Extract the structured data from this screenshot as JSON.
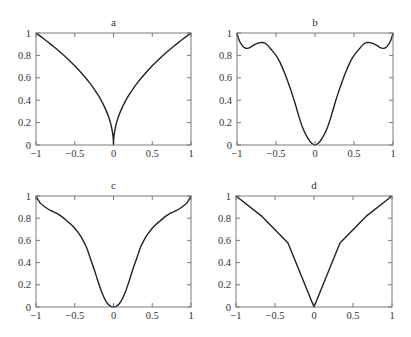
{
  "figure": {
    "width": 411,
    "height": 337,
    "colors": {
      "frame": "#7a7a7a",
      "curve": "#222222",
      "text": "#333333",
      "background": "#ffffff"
    }
  },
  "chart_data": [
    {
      "type": "line",
      "title": "a",
      "xlabel": "",
      "ylabel": "",
      "xlim": [
        -1,
        1
      ],
      "ylim": [
        0,
        1
      ],
      "xticks": [
        -1,
        -0.5,
        0,
        0.5,
        1
      ],
      "xtick_labels": [
        "−1",
        "−0.5",
        "0",
        "0.5",
        "1"
      ],
      "yticks": [
        0,
        0.2,
        0.4,
        0.6,
        0.8,
        1
      ],
      "ytick_labels": [
        "0",
        "0.2",
        "0.4",
        "0.6",
        "0.8",
        "1"
      ],
      "grid": false,
      "legend": null,
      "series": [
        {
          "name": "a",
          "x": [
            -1,
            -0.9,
            -0.8,
            -0.7,
            -0.6,
            -0.5,
            -0.4,
            -0.3,
            -0.2,
            -0.15,
            -0.1,
            -0.06,
            -0.03,
            -0.01,
            -0.002,
            0,
            0.002,
            0.01,
            0.03,
            0.06,
            0.1,
            0.15,
            0.2,
            0.3,
            0.4,
            0.5,
            0.6,
            0.7,
            0.8,
            0.9,
            1
          ],
          "y": [
            1,
            0.949,
            0.894,
            0.837,
            0.775,
            0.707,
            0.632,
            0.548,
            0.447,
            0.387,
            0.316,
            0.245,
            0.173,
            0.1,
            0.045,
            0,
            0.045,
            0.1,
            0.173,
            0.245,
            0.316,
            0.387,
            0.447,
            0.548,
            0.632,
            0.707,
            0.775,
            0.837,
            0.894,
            0.949,
            1
          ]
        }
      ],
      "frame_px": {
        "left": 36,
        "top": 33,
        "right": 191,
        "bottom": 145
      }
    },
    {
      "type": "line",
      "title": "b",
      "xlabel": "",
      "ylabel": "",
      "xlim": [
        -1,
        1
      ],
      "ylim": [
        0,
        1
      ],
      "xticks": [
        -1,
        -0.5,
        0,
        0.5,
        1
      ],
      "xtick_labels": [
        "−1",
        "−0.5",
        "0",
        "0.5",
        "1"
      ],
      "yticks": [
        0,
        0.2,
        0.4,
        0.6,
        0.8,
        1
      ],
      "ytick_labels": [
        "0",
        "0.2",
        "0.4",
        "0.6",
        "0.8",
        "1"
      ],
      "grid": false,
      "legend": null,
      "series": [
        {
          "name": "b",
          "x": [
            -1,
            -0.97,
            -0.93,
            -0.9,
            -0.87,
            -0.83,
            -0.78,
            -0.72,
            -0.67,
            -0.62,
            -0.57,
            -0.5,
            -0.45,
            -0.4,
            -0.35,
            -0.3,
            -0.25,
            -0.2,
            -0.15,
            -0.1,
            -0.05,
            0,
            0.05,
            0.1,
            0.15,
            0.2,
            0.25,
            0.3,
            0.35,
            0.4,
            0.45,
            0.5,
            0.57,
            0.62,
            0.67,
            0.72,
            0.78,
            0.83,
            0.87,
            0.9,
            0.93,
            0.97,
            1
          ],
          "y": [
            1,
            0.93,
            0.885,
            0.868,
            0.863,
            0.872,
            0.895,
            0.912,
            0.915,
            0.9,
            0.86,
            0.8,
            0.74,
            0.66,
            0.57,
            0.47,
            0.36,
            0.24,
            0.14,
            0.07,
            0.02,
            0,
            0.02,
            0.07,
            0.14,
            0.24,
            0.36,
            0.47,
            0.57,
            0.66,
            0.74,
            0.8,
            0.86,
            0.9,
            0.915,
            0.912,
            0.895,
            0.872,
            0.863,
            0.868,
            0.885,
            0.93,
            1
          ]
        }
      ],
      "frame_px": {
        "left": 237,
        "top": 33,
        "right": 393,
        "bottom": 145
      }
    },
    {
      "type": "line",
      "title": "c",
      "xlabel": "",
      "ylabel": "",
      "xlim": [
        -1,
        1
      ],
      "ylim": [
        0,
        1
      ],
      "xticks": [
        -1,
        -0.5,
        0,
        0.5,
        1
      ],
      "xtick_labels": [
        "−1",
        "−0.5",
        "0",
        "0.5",
        "1"
      ],
      "yticks": [
        0,
        0.2,
        0.4,
        0.6,
        0.8,
        1
      ],
      "ytick_labels": [
        "0",
        "0.2",
        "0.4",
        "0.6",
        "0.8",
        "1"
      ],
      "grid": false,
      "legend": null,
      "series": [
        {
          "name": "c",
          "x": [
            -1,
            -0.95,
            -0.9,
            -0.85,
            -0.8,
            -0.75,
            -0.7,
            -0.65,
            -0.6,
            -0.55,
            -0.5,
            -0.45,
            -0.4,
            -0.35,
            -0.3,
            -0.25,
            -0.2,
            -0.15,
            -0.1,
            -0.05,
            0,
            0.05,
            0.1,
            0.15,
            0.2,
            0.25,
            0.3,
            0.35,
            0.4,
            0.45,
            0.5,
            0.55,
            0.6,
            0.65,
            0.7,
            0.75,
            0.8,
            0.85,
            0.9,
            0.95,
            1
          ],
          "y": [
            1,
            0.94,
            0.91,
            0.885,
            0.865,
            0.85,
            0.83,
            0.805,
            0.775,
            0.745,
            0.71,
            0.665,
            0.61,
            0.54,
            0.44,
            0.34,
            0.23,
            0.13,
            0.055,
            0.012,
            0,
            0.012,
            0.055,
            0.13,
            0.23,
            0.34,
            0.44,
            0.54,
            0.61,
            0.665,
            0.71,
            0.745,
            0.775,
            0.805,
            0.83,
            0.85,
            0.865,
            0.885,
            0.91,
            0.94,
            1
          ]
        }
      ],
      "frame_px": {
        "left": 36,
        "top": 196,
        "right": 191,
        "bottom": 307
      }
    },
    {
      "type": "line",
      "title": "d",
      "xlabel": "",
      "ylabel": "",
      "xlim": [
        -1,
        1
      ],
      "ylim": [
        0,
        1
      ],
      "xticks": [
        -1,
        -0.5,
        0,
        0.5,
        1
      ],
      "xtick_labels": [
        "−1",
        "−0.5",
        "0",
        "0.5",
        "1"
      ],
      "yticks": [
        0,
        0.2,
        0.4,
        0.6,
        0.8,
        1
      ],
      "ytick_labels": [
        "0",
        "0.2",
        "0.4",
        "0.6",
        "0.8",
        "1"
      ],
      "grid": false,
      "legend": null,
      "series": [
        {
          "name": "d",
          "x": [
            -1,
            -0.6667,
            -0.3333,
            0,
            0.3333,
            0.6667,
            1
          ],
          "y": [
            1,
            0.816,
            0.577,
            0,
            0.577,
            0.816,
            1
          ]
        }
      ],
      "frame_px": {
        "left": 236,
        "top": 196,
        "right": 392,
        "bottom": 307
      }
    }
  ]
}
